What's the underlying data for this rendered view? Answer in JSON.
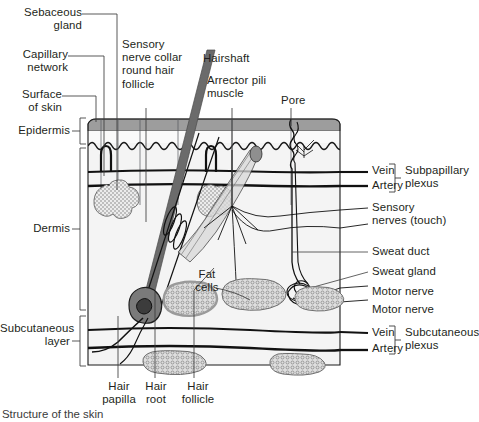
{
  "figure": {
    "caption": "Structure of the skin",
    "colors": {
      "text": "#231f20",
      "stroke": "#1a1a1a",
      "epidermis_band": "#9a9a9a",
      "tissue": "#f2f2f2",
      "hairshaft": "#6b6b6b",
      "gland_fill": "#e8e8e8",
      "fat_fill": "#d8d8d8",
      "leader": "#3c3c3c"
    }
  },
  "layers": [
    {
      "name": "Epidermis",
      "label": "Epidermis"
    },
    {
      "name": "Dermis",
      "label": "Dermis"
    },
    {
      "name": "Subcutaneous layer",
      "label": "Subcutaneous\nlayer"
    }
  ],
  "labels_left": [
    {
      "id": "sebaceous-gland",
      "text": "Sebaceous\ngland"
    },
    {
      "id": "capillary-network",
      "text": "Capillary\nnetwork"
    },
    {
      "id": "surface-of-skin",
      "text": "Surface\nof skin"
    }
  ],
  "labels_top": [
    {
      "id": "sensory-nerve-collar",
      "text": "Sensory\nnerve collar\nround hair\nfollicle"
    },
    {
      "id": "hairshaft",
      "text": "Hairshaft"
    },
    {
      "id": "arrector-pili-muscle",
      "text": "Arrector pili\nmuscle"
    },
    {
      "id": "pore",
      "text": "Pore"
    }
  ],
  "labels_right": [
    {
      "id": "vein-subpapillary",
      "text": "Vein"
    },
    {
      "id": "artery-subpapillary",
      "text": "Artery"
    },
    {
      "id": "subpapillary-plexus",
      "text": "Subpapillary\nplexus"
    },
    {
      "id": "sensory-nerves-touch",
      "text": "Sensory\nnerves (touch)"
    },
    {
      "id": "sweat-duct",
      "text": "Sweat duct"
    },
    {
      "id": "sweat-gland",
      "text": "Sweat gland"
    },
    {
      "id": "motor-nerve-1",
      "text": "Motor nerve"
    },
    {
      "id": "motor-nerve-2",
      "text": "Motor nerve"
    },
    {
      "id": "vein-subcutaneous",
      "text": "Vein"
    },
    {
      "id": "artery-subcutaneous",
      "text": "Artery"
    },
    {
      "id": "subcutaneous-plexus",
      "text": "Subcutaneous\nplexus"
    }
  ],
  "labels_inner": [
    {
      "id": "fat-cells",
      "text": "Fat\ncells"
    }
  ],
  "labels_bottom": [
    {
      "id": "hair-papilla",
      "text": "Hair\npapilla"
    },
    {
      "id": "hair-root",
      "text": "Hair\nroot"
    },
    {
      "id": "hair-follicle",
      "text": "Hair\nfollicle"
    }
  ]
}
